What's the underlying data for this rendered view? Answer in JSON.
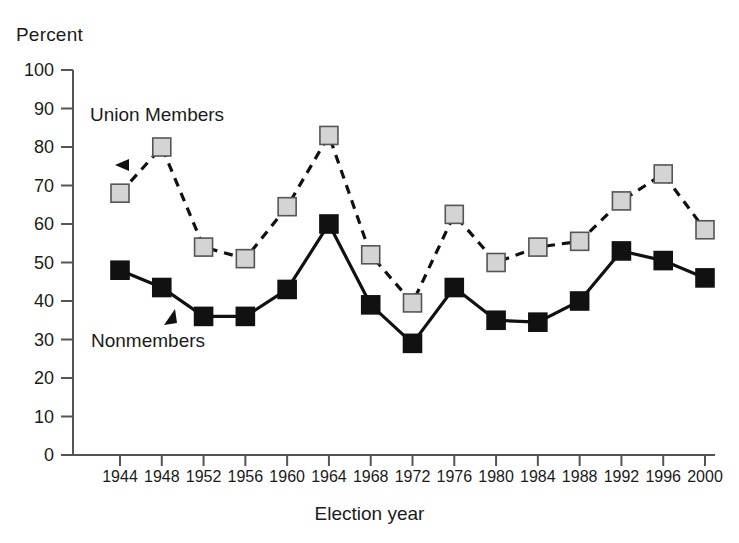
{
  "chart_data": {
    "type": "line",
    "title": "",
    "ylabel": "Percent",
    "xlabel": "Election year",
    "categories": [
      "1944",
      "1948",
      "1952",
      "1956",
      "1960",
      "1964",
      "1968",
      "1972",
      "1976",
      "1980",
      "1984",
      "1988",
      "1992",
      "1996",
      "2000"
    ],
    "ylim": [
      0,
      100
    ],
    "ytick_labels": [
      "0",
      "10",
      "20",
      "30",
      "40",
      "50",
      "60",
      "70",
      "80",
      "90",
      "100"
    ],
    "ytick_values": [
      0,
      10,
      20,
      30,
      40,
      50,
      60,
      70,
      80,
      90,
      100
    ],
    "grid": false,
    "legend_position": "inline-annotations",
    "series": [
      {
        "name": "Union Members",
        "style": "dashed",
        "marker": "square",
        "marker_fill": "#d4d4d4",
        "marker_stroke": "#555555",
        "line_color": "#111111",
        "values": [
          68,
          80,
          54,
          51,
          64.5,
          83,
          52,
          39.5,
          62.5,
          50,
          54,
          55.5,
          66,
          73,
          58.5
        ]
      },
      {
        "name": "Nonmembers",
        "style": "solid",
        "marker": "square",
        "marker_fill": "#111111",
        "marker_stroke": "#111111",
        "line_color": "#111111",
        "values": [
          48,
          43.5,
          36,
          36,
          43,
          60,
          39,
          29,
          43.5,
          35,
          34.5,
          40,
          53,
          50.5,
          46
        ]
      }
    ],
    "annotations": [
      {
        "text": "Union Members",
        "points_to": "Union Members series",
        "arrow": "left"
      },
      {
        "text": "Nonmembers",
        "points_to": "Nonmembers series",
        "arrow": "up-right"
      }
    ]
  },
  "colors": {
    "axis": "#555555",
    "union_marker": "#d4d4d4",
    "nonmember_marker": "#111111",
    "text": "#1b1b1b"
  }
}
